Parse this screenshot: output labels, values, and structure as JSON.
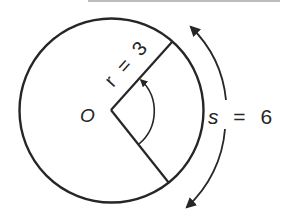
{
  "diagram": {
    "center_label": "O",
    "radius_label": {
      "var": "r",
      "eq": "=",
      "value": "3"
    },
    "arc_label": {
      "var": "s",
      "eq": "=",
      "value": "6"
    },
    "colors": {
      "stroke": "#262626",
      "background": "#ffffff",
      "top_rule": "#bdbdbd"
    }
  }
}
